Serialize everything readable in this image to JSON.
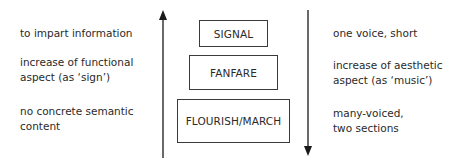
{
  "left_column": [
    {
      "lines": [
        "to impart information"
      ]
    },
    {
      "lines": [
        "increase of functional",
        "aspect (as ‘sign’)"
      ]
    },
    {
      "lines": [
        "no concrete semantic",
        "content"
      ]
    }
  ],
  "boxes": [
    {
      "label": "SIGNAL"
    },
    {
      "label": "FANFARE"
    },
    {
      "label": "FLOURISH/MARCH"
    }
  ],
  "right_column": [
    {
      "lines": [
        "one voice, short"
      ]
    },
    {
      "lines": [
        "increase of aesthetic",
        "aspect (as ‘music’)"
      ]
    },
    {
      "lines": [
        "many-voiced,",
        "two sections"
      ]
    }
  ],
  "arrows": {
    "left": {
      "direction": "up"
    },
    "right": {
      "direction": "down"
    }
  },
  "colors": {
    "ink": "#2a2a2a",
    "line": "#1a1a1a",
    "background": "#ffffff"
  }
}
